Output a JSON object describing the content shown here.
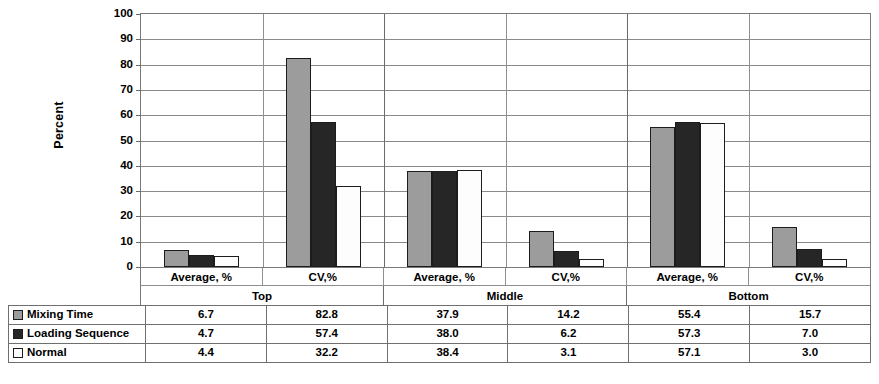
{
  "chart_data": {
    "type": "bar",
    "title": "",
    "xlabel": "",
    "ylabel": "Percent",
    "ylim": [
      0,
      100
    ],
    "ytick_step": 10,
    "yticks": [
      "100",
      "90",
      "80",
      "70",
      "60",
      "50",
      "40",
      "30",
      "20",
      "10",
      "0"
    ],
    "grid": true,
    "legend_position": "table-below",
    "group_labels": [
      "Top",
      "Middle",
      "Bottom"
    ],
    "categories": [
      "Average, %",
      "CV,%",
      "Average, %",
      "CV,%",
      "Average, %",
      "CV,%"
    ],
    "series": [
      {
        "name": "Mixing Time",
        "color": "#9c9c9c",
        "values": [
          6.7,
          82.8,
          37.9,
          14.2,
          55.4,
          15.7
        ]
      },
      {
        "name": "Loading Sequence",
        "color": "#262626",
        "values": [
          4.7,
          57.4,
          38.0,
          6.2,
          57.3,
          7.0
        ]
      },
      {
        "name": "Normal",
        "color": "#fdfdfd",
        "values": [
          4.4,
          32.2,
          38.4,
          3.1,
          57.1,
          3.0
        ]
      }
    ],
    "table": {
      "rows": [
        {
          "label": "Mixing Time",
          "swatch": "s0",
          "cells": [
            "6.7",
            "82.8",
            "37.9",
            "14.2",
            "55.4",
            "15.7"
          ]
        },
        {
          "label": "Loading Sequence",
          "swatch": "s1",
          "cells": [
            "4.7",
            "57.4",
            "38.0",
            "6.2",
            "57.3",
            "7.0"
          ]
        },
        {
          "label": "Normal",
          "swatch": "s2",
          "cells": [
            "4.4",
            "32.2",
            "38.4",
            "3.1",
            "57.1",
            "3.0"
          ]
        }
      ]
    }
  }
}
